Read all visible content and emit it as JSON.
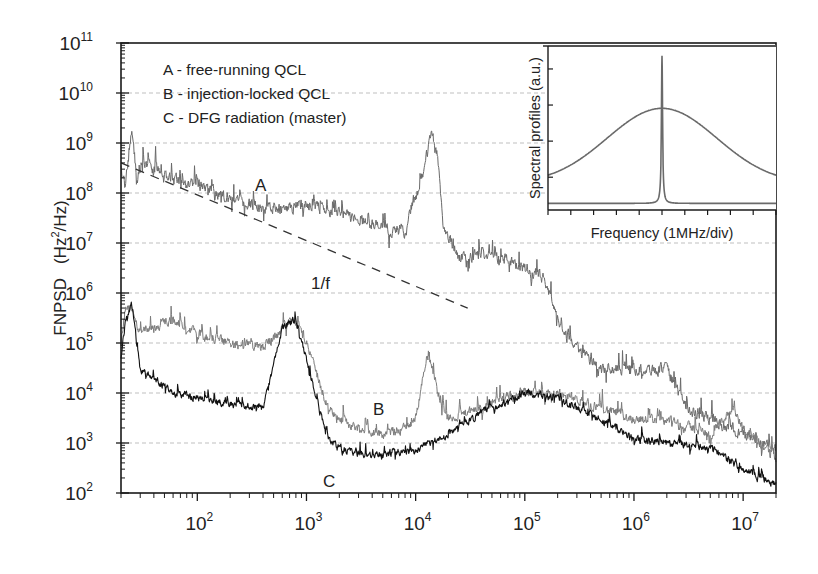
{
  "chart_data": {
    "type": "line",
    "title": "",
    "xlabel": "",
    "ylabel": "FNPSD",
    "ylabel_unit": "(Hz²/Hz)",
    "xscale": "log",
    "yscale": "log",
    "xlim": [
      20,
      20000000
    ],
    "ylim": [
      100,
      100000000000
    ],
    "x_ticks": [
      {
        "exp": "2",
        "value": 100
      },
      {
        "exp": "3",
        "value": 1000
      },
      {
        "exp": "4",
        "value": 10000
      },
      {
        "exp": "5",
        "value": 100000
      },
      {
        "exp": "6",
        "value": 1000000
      },
      {
        "exp": "7",
        "value": 10000000
      }
    ],
    "y_ticks": [
      {
        "exp": "2",
        "value": 100
      },
      {
        "exp": "3",
        "value": 1000
      },
      {
        "exp": "4",
        "value": 10000
      },
      {
        "exp": "5",
        "value": 100000
      },
      {
        "exp": "6",
        "value": 1000000
      },
      {
        "exp": "7",
        "value": 10000000
      },
      {
        "exp": "8",
        "value": 100000000
      },
      {
        "exp": "9",
        "value": 1000000000
      },
      {
        "exp": "10",
        "value": 10000000000
      },
      {
        "exp": "11",
        "value": 100000000000
      }
    ],
    "grid": "dashed horizontal at each decade",
    "legend": {
      "position": "upper-left",
      "entries": [
        "A - free-running QCL",
        "B - injection-locked QCL",
        "C - DFG radiation (master)"
      ]
    },
    "series": [
      {
        "name": "A - free-running QCL",
        "label": "A",
        "color": "#6a6a6a",
        "x": [
          20,
          22,
          25,
          28,
          32,
          40,
          60,
          100,
          200,
          400,
          700,
          1000,
          2000,
          3000,
          5000,
          8000,
          9000,
          10000,
          12000,
          14000,
          16000,
          18000,
          25000,
          40000,
          70000,
          100000,
          150000,
          200000,
          300000,
          500000,
          1000000,
          2000000,
          3000000,
          5000000,
          10000000,
          20000000
        ],
        "y": [
          300000000,
          150000000,
          1800000000,
          200000000,
          400000000,
          300000000,
          200000000,
          150000000,
          80000000,
          50000000,
          50000000,
          60000000,
          40000000,
          30000000,
          20000000,
          15000000,
          50000000,
          80000000,
          300000000,
          1800000000,
          500000000,
          20000000,
          5000000,
          6000000,
          5000000,
          3000000,
          2000000,
          300000,
          80000,
          30000,
          30000,
          30000,
          5000,
          3000,
          1500,
          800
        ],
        "noise_dex": 0.35
      },
      {
        "name": "B - injection-locked QCL",
        "label": "B",
        "color": "#7c7c7c",
        "x": [
          20,
          22,
          25,
          30,
          40,
          60,
          100,
          200,
          400,
          700,
          900,
          1200,
          1600,
          2000,
          3000,
          5000,
          8000,
          10000,
          13000,
          16000,
          20000,
          40000,
          60000,
          100000,
          200000,
          500000,
          1000000,
          2000000,
          5000000,
          8000000,
          10000000,
          20000000
        ],
        "y": [
          100000,
          500000,
          500000,
          150000,
          200000,
          300000,
          150000,
          100000,
          80000,
          300000,
          200000,
          30000,
          5000,
          3000,
          2000,
          1500,
          2000,
          3000,
          80000,
          10000,
          3000,
          5000,
          8000,
          10000,
          10000,
          5000,
          3000,
          3000,
          1500,
          5000,
          2000,
          500
        ],
        "noise_dex": 0.3
      },
      {
        "name": "C - DFG radiation (master)",
        "label": "C",
        "color": "#111111",
        "x": [
          20,
          22,
          25,
          30,
          40,
          60,
          100,
          200,
          400,
          600,
          800,
          1000,
          1300,
          1600,
          2000,
          3000,
          5000,
          10000,
          20000,
          40000,
          60000,
          100000,
          200000,
          500000,
          1000000,
          2000000,
          5000000,
          10000000,
          20000000
        ],
        "y": [
          50000,
          300000,
          600000,
          30000,
          20000,
          10000,
          8000,
          6000,
          5000,
          200000,
          300000,
          50000,
          5000,
          1200,
          800,
          600,
          600,
          700,
          1500,
          4000,
          6000,
          10000,
          8000,
          3000,
          1200,
          1000,
          800,
          300,
          150
        ],
        "noise_dex": 0.22
      },
      {
        "name": "1/f",
        "label": "1/f",
        "style": "dashed",
        "color": "#333333",
        "x": [
          20,
          30000
        ],
        "y": [
          400000000,
          500000
        ]
      }
    ],
    "annotations": [
      {
        "text": "A",
        "x": 400,
        "y": 100000000
      },
      {
        "text": "B",
        "x": 6000,
        "y": 8000
      },
      {
        "text": "C",
        "x": 1500,
        "y": 400
      },
      {
        "text": "1/f",
        "x": 450,
        "y": 2000000
      }
    ],
    "inset": {
      "type": "line",
      "xlabel": "Frequency (1MHz/div)",
      "ylabel": "Spectral profiles (a.u.)",
      "x_divisions": 10,
      "series": [
        {
          "name": "broad profile (free-running)",
          "shape": "gaussian",
          "center_div": 5.0,
          "peak": 0.62,
          "width_div": 2.4,
          "baseline": 0.16,
          "color": "#6a6a6a"
        },
        {
          "name": "narrow profile (injection-locked)",
          "shape": "lorentzian",
          "center_div": 5.0,
          "peak": 0.94,
          "width_div": 0.03,
          "baseline": 0.04,
          "color": "#6a6a6a"
        }
      ]
    }
  },
  "legend_lines": [
    "A - free-running QCL",
    "B - injection-locked QCL",
    "C - DFG radiation (master)"
  ],
  "labels": {
    "y_axis_main": "FNPSD",
    "y_axis_unit_open": "(Hz",
    "y_axis_unit_sup": "2",
    "y_axis_unit_close": "/Hz)",
    "annotation_a": "A",
    "annotation_b": "B",
    "annotation_c": "C",
    "annotation_1f": "1/f",
    "inset_xlabel": "Frequency (1MHz/div)",
    "inset_ylabel": "Spectral profiles (a.u.)",
    "tick_base": "10"
  }
}
